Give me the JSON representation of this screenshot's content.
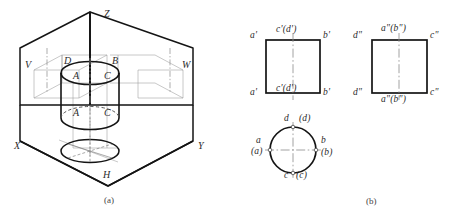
{
  "figure": {
    "captions": [
      {
        "id": "caption-a",
        "text": "(a)",
        "x": 104,
        "y": 196
      },
      {
        "id": "caption-b",
        "text": "(b)",
        "x": 366,
        "y": 197
      }
    ]
  },
  "isometric": {
    "name": "pictorial-projection-planes",
    "axis_labels": [
      {
        "id": "axis-z",
        "text": "Z",
        "x": 104,
        "y": 9
      },
      {
        "id": "axis-x",
        "text": "X",
        "x": 14,
        "y": 141
      },
      {
        "id": "axis-y",
        "text": "Y",
        "x": 198,
        "y": 141
      }
    ],
    "plane_labels": [
      {
        "id": "plane-v",
        "text": "V",
        "x": 25,
        "y": 60
      },
      {
        "id": "plane-w",
        "text": "W",
        "x": 184,
        "y": 60
      },
      {
        "id": "plane-h",
        "text": "H",
        "x": 103,
        "y": 172
      }
    ],
    "point_labels": [
      {
        "id": "point-d-top",
        "text": "D",
        "x": 64,
        "y": 57
      },
      {
        "id": "point-b-top",
        "text": "B",
        "x": 113,
        "y": 57
      },
      {
        "id": "point-a-top",
        "text": "A",
        "x": 74,
        "y": 76
      },
      {
        "id": "point-c-top",
        "text": "C",
        "x": 106,
        "y": 76
      },
      {
        "id": "point-a-bottom",
        "text": "A",
        "x": 74,
        "y": 113
      },
      {
        "id": "point-c-bottom",
        "text": "C",
        "x": 106,
        "y": 113
      }
    ]
  },
  "orthographic": {
    "front_view": {
      "name": "front-view-v-projection",
      "shape": "square",
      "labels": [
        {
          "id": "fv-a-prime-top",
          "text": "a'",
          "x": 250,
          "y": 34
        },
        {
          "id": "fv-cd-prime-top",
          "text": "c'(d')",
          "x": 282,
          "y": 28
        },
        {
          "id": "fv-b-prime-top",
          "text": "b'",
          "x": 323,
          "y": 34
        },
        {
          "id": "fv-a-prime-bottom",
          "text": "a'",
          "x": 250,
          "y": 90
        },
        {
          "id": "fv-cd-prime-bottom",
          "text": "c'(d')",
          "x": 282,
          "y": 85
        },
        {
          "id": "fv-b-prime-bottom",
          "text": "b'",
          "x": 323,
          "y": 90
        }
      ]
    },
    "side_view": {
      "name": "side-view-w-projection",
      "shape": "square",
      "labels": [
        {
          "id": "sv-d-dprime-top",
          "text": "d\"",
          "x": 355,
          "y": 34
        },
        {
          "id": "sv-ab-dprime-top",
          "text": "a\"(b\")",
          "x": 387,
          "y": 27
        },
        {
          "id": "sv-c-dprime-top",
          "text": "c\"",
          "x": 430,
          "y": 34
        },
        {
          "id": "sv-d-dprime-bottom",
          "text": "d\"",
          "x": 355,
          "y": 90
        },
        {
          "id": "sv-ab-dprime-bottom",
          "text": "a\"(b\")",
          "x": 387,
          "y": 96
        },
        {
          "id": "sv-c-dprime-bottom",
          "text": "c\"",
          "x": 430,
          "y": 90
        }
      ]
    },
    "top_view": {
      "name": "top-view-h-projection",
      "shape": "circle",
      "labels": [
        {
          "id": "tv-d",
          "text": "d",
          "x": 285,
          "y": 118
        },
        {
          "id": "tv-d-paren",
          "text": "(d)",
          "x": 300,
          "y": 118
        },
        {
          "id": "tv-a",
          "text": "a",
          "x": 256,
          "y": 141
        },
        {
          "id": "tv-a-paren",
          "text": "(a)",
          "x": 253,
          "y": 151
        },
        {
          "id": "tv-b",
          "text": "b",
          "x": 322,
          "y": 141
        },
        {
          "id": "tv-b-paren",
          "text": "(b)",
          "x": 322,
          "y": 152
        },
        {
          "id": "tv-c",
          "text": "c",
          "x": 285,
          "y": 175
        },
        {
          "id": "tv-c-paren",
          "text": "(c)",
          "x": 298,
          "y": 175
        }
      ]
    }
  },
  "colors": {
    "line": "#141414",
    "thin_line": "#6e6e6e",
    "center_line": "#8a8a8a",
    "text": "#2b2b2b",
    "background": "#ffffff"
  }
}
